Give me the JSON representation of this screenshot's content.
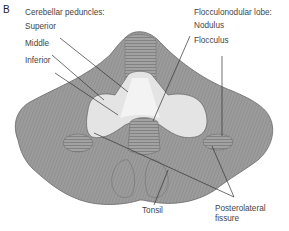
{
  "figure": {
    "panel_letter": "B",
    "colors": {
      "cortex": "#9a9a9a",
      "cortex_dark": "#7a7a7a",
      "folia_lines": "#6f6f6f",
      "peduncle_fill": "#e4e4e4",
      "peduncle_highlight": "#f2f2f2",
      "leader_line": "#333333",
      "label_text": "#444444"
    }
  },
  "labels": {
    "peduncles_heading": "Cerebellar peduncles:",
    "superior": "Superior",
    "middle": "Middle",
    "inferior": "Inferior",
    "flocculonodular_heading": "Flocculonodular lobe:",
    "nodulus": "Nodulus",
    "flocculus": "Flocculus",
    "tonsil": "Tonsil",
    "posterolateral_line1": "Posterolateral",
    "posterolateral_line2": "fissure"
  }
}
